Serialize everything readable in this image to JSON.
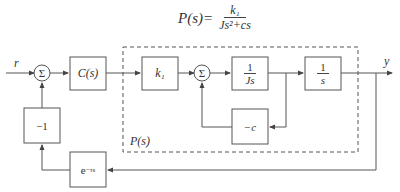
{
  "formula": {
    "lhs": "P(s)=",
    "numerator": "k₁",
    "denominator": "Js²+cs"
  },
  "signals": {
    "input": "r",
    "output": "y"
  },
  "blocks": {
    "sum1": "Σ",
    "controller": "C(s)",
    "gain": "k₁",
    "sum2": "Σ",
    "integrator1_num": "1",
    "integrator1_den": "Js",
    "integrator2_num": "1",
    "integrator2_den": "s",
    "damping": "−c",
    "feedback_gain": "−1",
    "delay": "e",
    "delay_exp": "−τs"
  },
  "plant_label": "P(s)",
  "colors": {
    "line": "#555555",
    "text": "#333333"
  }
}
